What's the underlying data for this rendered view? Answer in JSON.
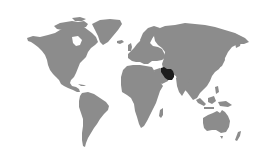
{
  "map": {
    "type": "world-locator",
    "highlighted_region": "Iran",
    "colors": {
      "background": "#ffffff",
      "land": "#8c8c8c",
      "highlight": "#1c1c1c"
    }
  }
}
